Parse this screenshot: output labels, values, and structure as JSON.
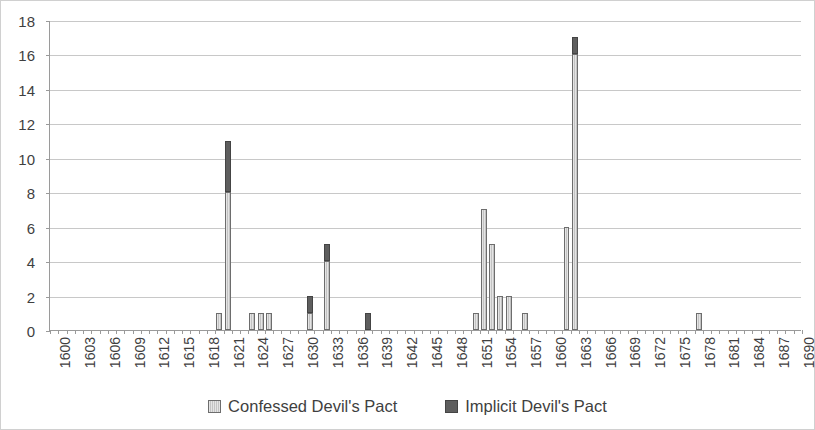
{
  "chart_data": {
    "type": "bar",
    "stacked": true,
    "title": "",
    "subtitle": "",
    "xlabel": "",
    "ylabel": "",
    "ylim": [
      0,
      18
    ],
    "ytick_step": 2,
    "yticks": [
      0,
      2,
      4,
      6,
      8,
      10,
      12,
      14,
      16,
      18
    ],
    "grid": "horizontal",
    "legend_position": "bottom",
    "x_start": 1600,
    "x_end": 1690,
    "xtick_label_step": 3,
    "xtick_labels": [
      "1600",
      "1603",
      "1606",
      "1609",
      "1612",
      "1615",
      "1618",
      "1621",
      "1624",
      "1627",
      "1630",
      "1633",
      "1636",
      "1639",
      "1642",
      "1645",
      "1648",
      "1651",
      "1654",
      "1657",
      "1660",
      "1663",
      "1666",
      "1669",
      "1672",
      "1675",
      "1678",
      "1681",
      "1684",
      "1687",
      "1690"
    ],
    "categories": [
      1600,
      1601,
      1602,
      1603,
      1604,
      1605,
      1606,
      1607,
      1608,
      1609,
      1610,
      1611,
      1612,
      1613,
      1614,
      1615,
      1616,
      1617,
      1618,
      1619,
      1620,
      1621,
      1622,
      1623,
      1624,
      1625,
      1626,
      1627,
      1628,
      1629,
      1630,
      1631,
      1632,
      1633,
      1634,
      1635,
      1636,
      1637,
      1638,
      1639,
      1640,
      1641,
      1642,
      1643,
      1644,
      1645,
      1646,
      1647,
      1648,
      1649,
      1650,
      1651,
      1652,
      1653,
      1654,
      1655,
      1656,
      1657,
      1658,
      1659,
      1660,
      1661,
      1662,
      1663,
      1664,
      1665,
      1666,
      1667,
      1668,
      1669,
      1670,
      1671,
      1672,
      1673,
      1674,
      1675,
      1676,
      1677,
      1678,
      1679,
      1680,
      1681,
      1682,
      1683,
      1684,
      1685,
      1686,
      1687,
      1688,
      1689,
      1690
    ],
    "series": [
      {
        "name": "Confessed Devil's Pact",
        "color": "#c3c3c3",
        "values": [
          0,
          0,
          0,
          0,
          0,
          0,
          0,
          0,
          0,
          0,
          0,
          0,
          0,
          0,
          0,
          0,
          0,
          0,
          0,
          0,
          1,
          8,
          0,
          0,
          1,
          1,
          1,
          0,
          0,
          0,
          0,
          1,
          0,
          4,
          0,
          0,
          0,
          0,
          0,
          0,
          0,
          0,
          0,
          0,
          0,
          0,
          0,
          0,
          0,
          0,
          0,
          1,
          7,
          5,
          2,
          2,
          0,
          1,
          0,
          0,
          0,
          0,
          6,
          16,
          0,
          0,
          0,
          0,
          0,
          0,
          0,
          0,
          0,
          0,
          0,
          0,
          0,
          0,
          1,
          0,
          0,
          0,
          0,
          0,
          0,
          0,
          0,
          0,
          0,
          0,
          0
        ]
      },
      {
        "name": "Implicit Devil's Pact",
        "color": "#5e5e5e",
        "values": [
          0,
          0,
          0,
          0,
          0,
          0,
          0,
          0,
          0,
          0,
          0,
          0,
          0,
          0,
          0,
          0,
          0,
          0,
          0,
          0,
          0,
          3,
          0,
          0,
          0,
          0,
          0,
          0,
          0,
          0,
          0,
          1,
          0,
          1,
          0,
          0,
          0,
          0,
          1,
          0,
          0,
          0,
          0,
          0,
          0,
          0,
          0,
          0,
          0,
          0,
          0,
          0,
          0,
          0,
          0,
          0,
          0,
          0,
          0,
          0,
          0,
          0,
          0,
          1,
          0,
          0,
          0,
          0,
          0,
          0,
          0,
          0,
          0,
          0,
          0,
          0,
          0,
          0,
          0,
          0,
          0,
          0,
          0,
          0,
          0,
          0,
          0,
          0,
          0,
          0,
          0
        ]
      }
    ],
    "totals": [
      0,
      0,
      0,
      0,
      0,
      0,
      0,
      0,
      0,
      0,
      0,
      0,
      0,
      0,
      0,
      0,
      0,
      0,
      0,
      0,
      1,
      11,
      0,
      0,
      1,
      1,
      1,
      0,
      0,
      0,
      0,
      2,
      0,
      5,
      0,
      0,
      0,
      0,
      1,
      0,
      0,
      0,
      0,
      0,
      0,
      0,
      0,
      0,
      0,
      0,
      0,
      1,
      7,
      5,
      2,
      2,
      0,
      1,
      0,
      0,
      0,
      0,
      6,
      17,
      0,
      0,
      0,
      0,
      0,
      0,
      0,
      0,
      0,
      0,
      0,
      0,
      0,
      0,
      1,
      0,
      0,
      0,
      0,
      0,
      0,
      0,
      0,
      0,
      0,
      0,
      0
    ]
  },
  "legend": {
    "items": [
      {
        "label": "Confessed Devil's Pact",
        "swatch": "confessed"
      },
      {
        "label": "Implicit Devil's Pact",
        "swatch": "implicit"
      }
    ]
  }
}
